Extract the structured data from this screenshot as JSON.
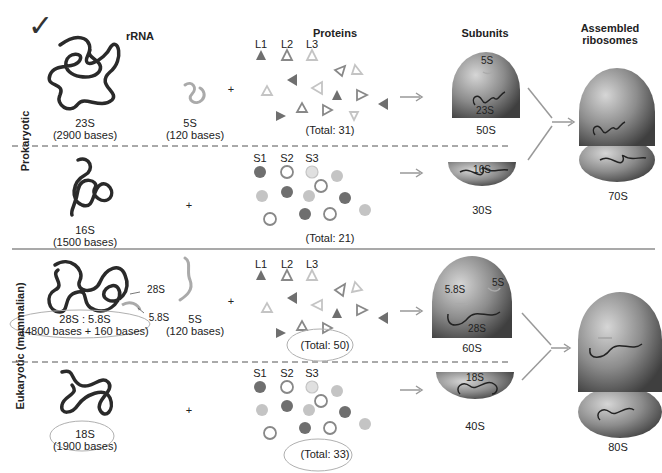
{
  "headers": {
    "rrna": "rRNA",
    "proteins": "Proteins",
    "subunits": "Subunits",
    "assembled": "Assembled ribosomes"
  },
  "checkmark": "✓",
  "sections": {
    "prokaryotic": {
      "label": "Prokaryotic",
      "large": {
        "rrna_main_name": "23S",
        "rrna_main_size": "(2900 bases)",
        "rrna_5s_name": "5S",
        "rrna_5s_size": "(120 bases)",
        "plus": "+",
        "protein_labels": [
          "L1",
          "L2",
          "L3"
        ],
        "protein_total": "(Total:  31)",
        "subunit_labels": [
          "5S",
          "23S"
        ],
        "subunit_name": "50S"
      },
      "small": {
        "rrna_main_name": "16S",
        "rrna_main_size": "(1500 bases)",
        "plus": "+",
        "protein_labels": [
          "S1",
          "S2",
          "S3"
        ],
        "protein_total": "(Total:  21)",
        "subunit_labels": [
          "16S"
        ],
        "subunit_name": "30S"
      },
      "assembled_name": "70S"
    },
    "eukaryotic": {
      "label": "Eukaryotic (mammalian)",
      "large": {
        "rrna_callout_28s": "28S",
        "rrna_callout_58s": "5.8S",
        "rrna_main_name": "28S : 5.8S",
        "rrna_main_size": "(4800 bases + 160 bases)",
        "rrna_5s_name": "5S",
        "rrna_5s_size": "(120 bases)",
        "plus": "+",
        "protein_labels": [
          "L1",
          "L2",
          "L3"
        ],
        "protein_total": "(Total:  50)",
        "subunit_labels": [
          "5.8S",
          "5S",
          "28S"
        ],
        "subunit_name": "60S"
      },
      "small": {
        "rrna_main_name": "18S",
        "rrna_main_size": "(1900 bases)",
        "plus": "+",
        "protein_labels": [
          "S1",
          "S2",
          "S3"
        ],
        "protein_total": "(Total:  33)",
        "subunit_labels": [
          "18S"
        ],
        "subunit_name": "40S"
      },
      "assembled_name": "80S"
    }
  },
  "colors": {
    "dark_protein": "#6f6f6f",
    "light_protein": "#c4c4c4",
    "rrna_dark": "#2a2a2a",
    "rrna_5s": "#aaaaaa",
    "subunit_gray": "#8a8a8a",
    "annotation_ellipse": "#b0b0b0"
  }
}
